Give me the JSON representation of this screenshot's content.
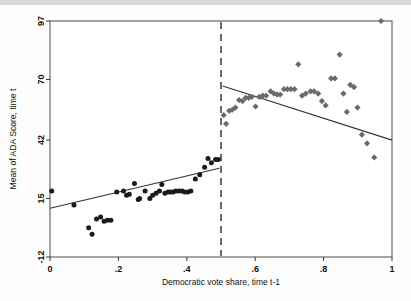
{
  "chart_data": {
    "type": "scatter",
    "title": "",
    "xlabel": "Democratic vote share, time t-1",
    "ylabel": "Mean of ADA Score, time t",
    "xlim": [
      0,
      1
    ],
    "ylim": [
      -12,
      97
    ],
    "xticks": [
      "0",
      ".2",
      ".4",
      ".6",
      ".8",
      "1"
    ],
    "xtick_values": [
      0,
      0.2,
      0.4,
      0.6,
      0.8,
      1
    ],
    "yticks": [
      "-12",
      "15",
      "42",
      "70",
      "97"
    ],
    "ytick_values": [
      -12,
      15,
      42,
      70,
      97
    ],
    "grid": false,
    "legend": "none",
    "cutoff": 0.5,
    "cutoff_style": "dashed vertical line",
    "series": [
      {
        "name": "Democrat loses (below cutoff)",
        "marker": "circle",
        "color": "#1a1a1a",
        "points": [
          [
            0.005,
            18.5
          ],
          [
            0.07,
            12.0
          ],
          [
            0.113,
            1.5
          ],
          [
            0.123,
            -1.5
          ],
          [
            0.136,
            5.5
          ],
          [
            0.148,
            6.5
          ],
          [
            0.158,
            4.5
          ],
          [
            0.168,
            5.0
          ],
          [
            0.178,
            5.0
          ],
          [
            0.195,
            18.0
          ],
          [
            0.215,
            18.5
          ],
          [
            0.224,
            16.5
          ],
          [
            0.232,
            17.0
          ],
          [
            0.247,
            22.0
          ],
          [
            0.258,
            14.5
          ],
          [
            0.262,
            15.0
          ],
          [
            0.278,
            18.5
          ],
          [
            0.292,
            15.0
          ],
          [
            0.3,
            16.5
          ],
          [
            0.31,
            17.5
          ],
          [
            0.32,
            18.5
          ],
          [
            0.327,
            21.5
          ],
          [
            0.336,
            17.5
          ],
          [
            0.345,
            18.0
          ],
          [
            0.352,
            18.0
          ],
          [
            0.36,
            18.0
          ],
          [
            0.368,
            18.5
          ],
          [
            0.377,
            18.5
          ],
          [
            0.386,
            18.5
          ],
          [
            0.394,
            18.0
          ],
          [
            0.403,
            18.0
          ],
          [
            0.412,
            18.5
          ],
          [
            0.425,
            24.0
          ],
          [
            0.438,
            26.0
          ],
          [
            0.452,
            29.5
          ],
          [
            0.462,
            33.5
          ],
          [
            0.472,
            31.5
          ],
          [
            0.484,
            33.0
          ],
          [
            0.492,
            33.0
          ]
        ]
      },
      {
        "name": "Democrat wins (above cutoff)",
        "marker": "diamond",
        "color": "#6a6a6a",
        "points": [
          [
            0.508,
            53.5
          ],
          [
            0.515,
            49.5
          ],
          [
            0.524,
            55.5
          ],
          [
            0.533,
            56.0
          ],
          [
            0.542,
            57.0
          ],
          [
            0.553,
            60.5
          ],
          [
            0.563,
            60.0
          ],
          [
            0.572,
            61.5
          ],
          [
            0.581,
            61.5
          ],
          [
            0.59,
            62.0
          ],
          [
            0.601,
            57.5
          ],
          [
            0.612,
            62.0
          ],
          [
            0.622,
            62.5
          ],
          [
            0.632,
            62.5
          ],
          [
            0.645,
            64.5
          ],
          [
            0.655,
            63.5
          ],
          [
            0.664,
            63.0
          ],
          [
            0.673,
            63.0
          ],
          [
            0.684,
            65.5
          ],
          [
            0.694,
            65.5
          ],
          [
            0.704,
            65.5
          ],
          [
            0.715,
            65.5
          ],
          [
            0.726,
            77.0
          ],
          [
            0.737,
            62.5
          ],
          [
            0.748,
            63.5
          ],
          [
            0.762,
            64.5
          ],
          [
            0.772,
            64.5
          ],
          [
            0.784,
            63.5
          ],
          [
            0.795,
            60.0
          ],
          [
            0.806,
            58.0
          ],
          [
            0.822,
            70.5
          ],
          [
            0.833,
            70.5
          ],
          [
            0.847,
            81.5
          ],
          [
            0.858,
            63.5
          ],
          [
            0.868,
            55.0
          ],
          [
            0.878,
            67.5
          ],
          [
            0.889,
            66.5
          ],
          [
            0.899,
            57.0
          ],
          [
            0.912,
            44.5
          ],
          [
            0.927,
            40.5
          ],
          [
            0.948,
            34.0
          ],
          [
            0.968,
            97.0
          ]
        ]
      }
    ],
    "fits": [
      {
        "name": "left-fit-line",
        "side": "left",
        "x_start": 0.0,
        "y_start": 10.5,
        "x_end": 0.495,
        "y_end": 29.0,
        "color": "#333333"
      },
      {
        "name": "right-fit-line",
        "side": "right",
        "x_start": 0.505,
        "y_start": 67.0,
        "x_end": 1.0,
        "y_end": 42.0,
        "color": "#333333"
      }
    ]
  }
}
